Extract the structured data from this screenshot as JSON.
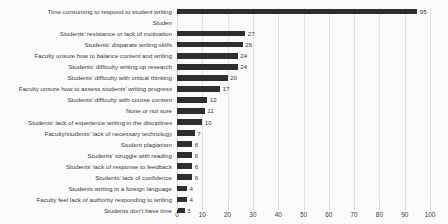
{
  "chart_data": {
    "type": "bar",
    "orientation": "horizontal",
    "title": "",
    "xlabel": "",
    "ylabel": "",
    "xlim": [
      0,
      100
    ],
    "xticks": [
      0,
      10,
      20,
      30,
      40,
      50,
      60,
      70,
      80,
      90,
      100
    ],
    "xtick_labels": [
      "0",
      "10",
      "20",
      "30",
      "40",
      "50",
      "60",
      "70",
      "80",
      "90",
      "100"
    ],
    "grid": true,
    "legend": false,
    "bar_color": "#2e2e2e",
    "background_color": "#fbfbfb",
    "gridline_color": "#e3e3e3",
    "text_color": "#3a3a3a",
    "categories": [
      "Time consuming to respond to student writing",
      "Studen",
      "Students’ resistance or lack of motivation",
      "Students’ disparate writing skills",
      "Faculty unsure how to balance content and writing",
      "Students’ difficulty writing up research",
      "Students’ difficulty with critical thinking",
      "Faculty unsure how to assess students’ writing progress",
      "Students’ difficulty with course content",
      "None or not sure",
      "Students’ lack of experience writing in the disciplines",
      "Faculty/students’ lack of necessary technology",
      "Student plagiarism",
      "Students’ struggle with reading",
      "Students’ lack of response to feedback",
      "Students’ lack of confidence",
      "Students writing in a foreign language",
      "Faculty feel lack of authority responding to writing",
      "Students don’t have time"
    ],
    "values": [
      95,
      null,
      27,
      26,
      24,
      24,
      20,
      17,
      12,
      11,
      10,
      7,
      6,
      6,
      6,
      6,
      4,
      4,
      3
    ],
    "value_labels": [
      "95",
      "",
      "27",
      "26",
      "24",
      "24",
      "20",
      "17",
      "12",
      "11",
      "10",
      "7",
      "6",
      "6",
      "6",
      "6",
      "4",
      "4",
      "3"
    ]
  }
}
